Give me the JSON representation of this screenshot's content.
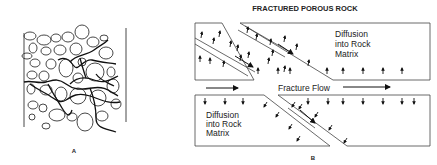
{
  "panel_a": {
    "label": "A"
  },
  "panel_b": {
    "title": "FRACTURED POROUS ROCK",
    "upper_label_lines": [
      "Diffusion",
      "into Rock",
      "Matrix"
    ],
    "lower_label_lines": [
      "Diffusion",
      "into Rock",
      "Matrix"
    ],
    "flow_label": "Fracture Flow",
    "label": "B"
  },
  "colors": {
    "ink": "#222222",
    "background": "#ffffff"
  }
}
